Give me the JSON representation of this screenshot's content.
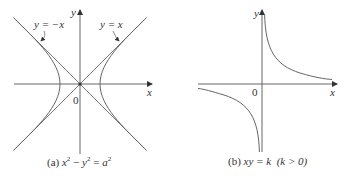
{
  "figures": [
    {
      "id": "a",
      "equation_label": "x² − y² = a²",
      "caption_prefix": "(a)",
      "axis_labels": {
        "x": "x",
        "y": "y",
        "origin": "0"
      },
      "asymptote_labels": [
        "y = −x",
        "y = x"
      ],
      "caption_parts": {
        "prefix": "(a) ",
        "x": "x",
        "y": "y",
        "a": "a",
        "minus": " − ",
        "eq": " = ",
        "exp": "2"
      }
    },
    {
      "id": "b",
      "equation_label": "xy = k (k > 0)",
      "caption_prefix": "(b)",
      "axis_labels": {
        "x": "x",
        "y": "y",
        "origin": "0"
      },
      "caption_parts": {
        "prefix": "(b) ",
        "eq": "xy = k",
        "cond": "(k > 0)"
      }
    }
  ]
}
